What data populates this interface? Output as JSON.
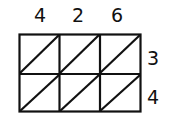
{
  "diagram": {
    "type": "lattice-multiplication-grid",
    "multiplicand_digits": [
      "4",
      "2",
      "6"
    ],
    "multiplier_digits": [
      "3",
      "4"
    ],
    "rows": 2,
    "cols": 3,
    "colors": {
      "line": "#111111",
      "background": "#ffffff"
    }
  }
}
